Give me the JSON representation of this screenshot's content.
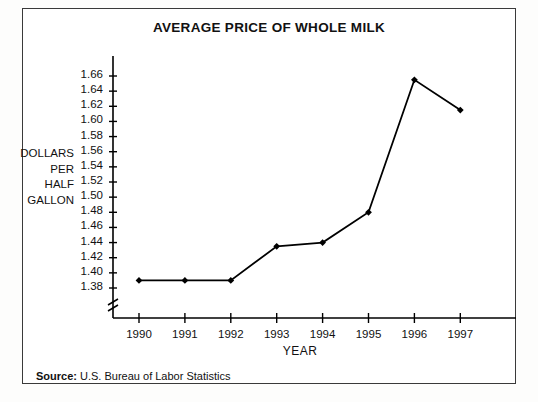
{
  "figure": {
    "title": "AVERAGE PRICE OF WHOLE MILK",
    "source_label": "Source:",
    "source_text": "U.S. Bureau of Labor Statistics",
    "border_color": "#3a3a3a",
    "line_color": "#000000",
    "background": "#ffffff"
  },
  "ylabel_lines": [
    "DOLLARS",
    "PER",
    "HALF",
    "GALLON"
  ],
  "chart_data": {
    "type": "line",
    "title": "AVERAGE PRICE OF WHOLE MILK",
    "xlabel": "YEAR",
    "ylabel": "DOLLARS PER HALF GALLON",
    "categories": [
      "1990",
      "1991",
      "1992",
      "1993",
      "1994",
      "1995",
      "1996",
      "1997"
    ],
    "x": [
      1990,
      1991,
      1992,
      1993,
      1994,
      1995,
      1996,
      1997
    ],
    "values": [
      1.39,
      1.39,
      1.39,
      1.435,
      1.44,
      1.48,
      1.655,
      1.615
    ],
    "ylim": [
      1.37,
      1.67
    ],
    "yticks": [
      "1.38",
      "1.40",
      "1.42",
      "1.44",
      "1.46",
      "1.48",
      "1.50",
      "1.52",
      "1.54",
      "1.56",
      "1.58",
      "1.60",
      "1.62",
      "1.64",
      "1.66"
    ],
    "ytick_values": [
      1.38,
      1.4,
      1.42,
      1.44,
      1.46,
      1.48,
      1.5,
      1.52,
      1.54,
      1.56,
      1.58,
      1.6,
      1.62,
      1.64,
      1.66
    ],
    "xticks": [
      "1990",
      "1991",
      "1992",
      "1993",
      "1994",
      "1995",
      "1996",
      "1997"
    ],
    "grid": false,
    "legend": "none",
    "marker": "diamond",
    "y_axis_break": true,
    "series": [
      {
        "name": "Average price of whole milk (dollars per half gallon)",
        "values": [
          1.39,
          1.39,
          1.39,
          1.435,
          1.44,
          1.48,
          1.655,
          1.615
        ]
      }
    ]
  }
}
